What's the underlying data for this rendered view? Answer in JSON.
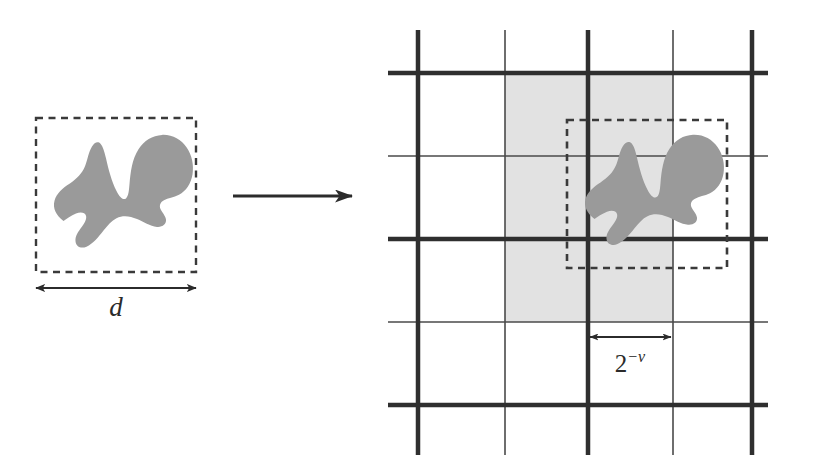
{
  "figure": {
    "background_color": "#ffffff",
    "width": 833,
    "height": 474
  },
  "left_panel": {
    "name": "source-set-panel",
    "bounding_box": {
      "style": "dashed",
      "color": "#3a3a3a",
      "x": 36,
      "y": 118,
      "width": 160,
      "height": 154
    },
    "blob": {
      "label": "set",
      "fill_color": "#9a9a9a"
    },
    "diameter_measure": {
      "label": "d",
      "arrow_style": "double-headed",
      "color": "#2b2b2b",
      "x1": 36,
      "x2": 196,
      "y": 288
    }
  },
  "transform_arrow": {
    "label": "",
    "direction": "right",
    "color": "#2b2b2b",
    "x1": 233,
    "x2": 352,
    "y": 196
  },
  "right_panel": {
    "name": "dyadic-grid-panel",
    "grid": {
      "thick_color": "#2f2f2f",
      "thin_color": "#4a4a4a",
      "thick_width": 4.5,
      "thin_width": 1.6,
      "vertical_lines": [
        {
          "x": 418,
          "weight": "thick"
        },
        {
          "x": 505,
          "weight": "thin"
        },
        {
          "x": 588,
          "weight": "thick"
        },
        {
          "x": 673,
          "weight": "thin"
        },
        {
          "x": 752,
          "weight": "thick"
        }
      ],
      "horizontal_lines": [
        {
          "y": 73,
          "weight": "thick"
        },
        {
          "y": 156,
          "weight": "thin"
        },
        {
          "y": 239,
          "weight": "thick"
        },
        {
          "y": 322,
          "weight": "thin"
        },
        {
          "y": 405,
          "weight": "thick"
        }
      ],
      "extent": {
        "x_min": 388,
        "x_max": 768,
        "y_min": 30,
        "y_max": 455
      }
    },
    "shaded_region": {
      "fill_color": "#e2e2e2",
      "x": 505,
      "y": 73,
      "width": 168,
      "height": 249
    },
    "bounding_box": {
      "style": "dashed",
      "color": "#3a3a3a",
      "x": 567,
      "y": 120,
      "width": 160,
      "height": 148
    },
    "blob": {
      "label": "set",
      "fill_color": "#9a9a9a"
    },
    "cell_size_measure": {
      "label_base": "2",
      "label_exponent": "−ν",
      "label_full": "2^{-ν}",
      "arrow_style": "double-headed",
      "color": "#2b2b2b",
      "x1": 588,
      "x2": 673,
      "y": 337,
      "text_x": 630,
      "text_y": 370
    }
  }
}
